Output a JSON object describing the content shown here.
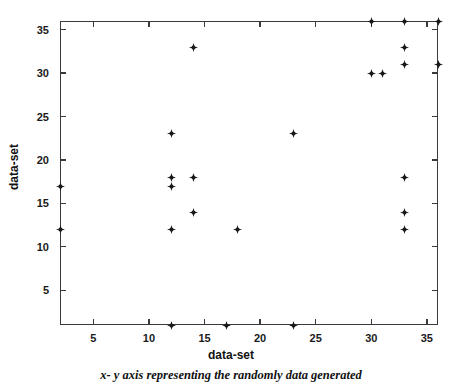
{
  "chart_data": {
    "type": "scatter",
    "title": "",
    "xlabel": "data-set",
    "ylabel": "data-set",
    "caption": "x- y axis representing the randomly data generated",
    "xlim": [
      2,
      36
    ],
    "ylim": [
      1,
      36
    ],
    "xticks": [
      5,
      10,
      15,
      20,
      25,
      30,
      35
    ],
    "yticks": [
      5,
      10,
      15,
      20,
      25,
      30,
      35
    ],
    "xticklabels": [
      "5",
      "10",
      "15",
      "20",
      "25",
      "30",
      "35"
    ],
    "yticklabels": [
      "5",
      "10",
      "15",
      "20",
      "25",
      "30",
      "35"
    ],
    "grid": false,
    "legend": false,
    "marker": "four-pointed-star",
    "marker_color": "#1a1a1a",
    "points": [
      {
        "x": 2,
        "y": 17
      },
      {
        "x": 2,
        "y": 12
      },
      {
        "x": 12,
        "y": 23
      },
      {
        "x": 12,
        "y": 18
      },
      {
        "x": 12,
        "y": 17
      },
      {
        "x": 12,
        "y": 12
      },
      {
        "x": 12,
        "y": 1
      },
      {
        "x": 14,
        "y": 33
      },
      {
        "x": 14,
        "y": 18
      },
      {
        "x": 14,
        "y": 14
      },
      {
        "x": 17,
        "y": 1
      },
      {
        "x": 18,
        "y": 12
      },
      {
        "x": 23,
        "y": 23
      },
      {
        "x": 23,
        "y": 1
      },
      {
        "x": 30,
        "y": 36
      },
      {
        "x": 30,
        "y": 30
      },
      {
        "x": 31,
        "y": 30
      },
      {
        "x": 33,
        "y": 36
      },
      {
        "x": 33,
        "y": 33
      },
      {
        "x": 33,
        "y": 31
      },
      {
        "x": 33,
        "y": 18
      },
      {
        "x": 33,
        "y": 14
      },
      {
        "x": 33,
        "y": 12
      },
      {
        "x": 36,
        "y": 36
      },
      {
        "x": 36,
        "y": 31
      }
    ]
  }
}
